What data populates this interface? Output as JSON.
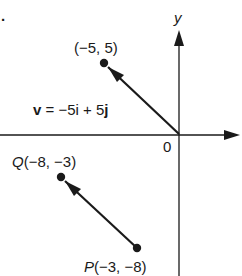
{
  "diagram": {
    "problem_marker": ".",
    "axes": {
      "x_label": "",
      "y_label": "y",
      "origin_label": "0"
    },
    "points": [
      {
        "id": "A",
        "name": "",
        "coords": "(−5, 5)",
        "x": -5,
        "y": 5
      },
      {
        "id": "Q",
        "name": "Q",
        "coords": "(−8, −3)",
        "x": -8,
        "y": -3
      },
      {
        "id": "P",
        "name": "P",
        "coords": "(−3, −8)",
        "x": -3,
        "y": -8
      }
    ],
    "vectors": [
      {
        "from": "origin",
        "to": "A",
        "label_v": "v",
        "label_eq": " = −5",
        "label_i": "i",
        "label_plus": " + 5",
        "label_j": "j"
      },
      {
        "from": "P",
        "to": "Q"
      }
    ],
    "colors": {
      "ink": "#1a1a1a",
      "background": "#ffffff"
    }
  }
}
